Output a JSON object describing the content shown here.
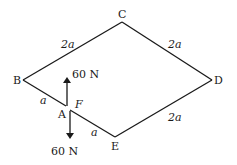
{
  "diagram": {
    "type": "truss-frame",
    "nodes": {
      "A": {
        "label": "A"
      },
      "B": {
        "label": "B"
      },
      "C": {
        "label": "C"
      },
      "D": {
        "label": "D"
      },
      "E": {
        "label": "E"
      },
      "F": {
        "label": "F"
      }
    },
    "edges": [
      {
        "from": "B",
        "to": "C",
        "length": "2a"
      },
      {
        "from": "C",
        "to": "D",
        "length": "2a"
      },
      {
        "from": "D",
        "to": "E",
        "length": "2a"
      },
      {
        "from": "B",
        "to": "A",
        "length": "a"
      },
      {
        "from": "F",
        "to": "E",
        "length": "a"
      }
    ],
    "forces": [
      {
        "at": "A",
        "direction": "up",
        "label": "60 N"
      },
      {
        "at": "F",
        "direction": "down",
        "label": "60 N"
      }
    ]
  },
  "labels": {
    "bc": "2a",
    "cd": "2a",
    "de": "2a",
    "ba": "a",
    "fe": "a",
    "force_up": "60 N",
    "force_down": "60 N"
  }
}
